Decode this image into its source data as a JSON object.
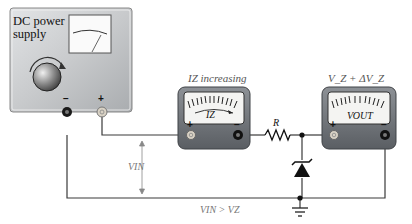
{
  "power_supply": {
    "title": "DC power supply",
    "minus_label": "−",
    "plus_label": "+"
  },
  "ammeter": {
    "top_label": "I_Z increasing",
    "top_label_display": "IZ increasing",
    "face_label": "IZ",
    "minus_label": "−",
    "plus_label": "+"
  },
  "voltmeter": {
    "top_label": "V_Z + ΔV_Z",
    "face_label": "VOUT",
    "minus_label": "−",
    "plus_label": "+"
  },
  "circuit": {
    "resistor_label": "R",
    "vin_label": "VIN",
    "condition_label": "VIN > VZ",
    "components": [
      "dc-power-supply",
      "ammeter",
      "resistor",
      "zener-diode",
      "voltmeter",
      "ground"
    ]
  },
  "colors": {
    "wire": "#3a3a3a",
    "meter_body": "#6f7378",
    "meter_face": "#f4f4f2",
    "psu_body": "#c9cbcd",
    "annotation": "#888888"
  }
}
